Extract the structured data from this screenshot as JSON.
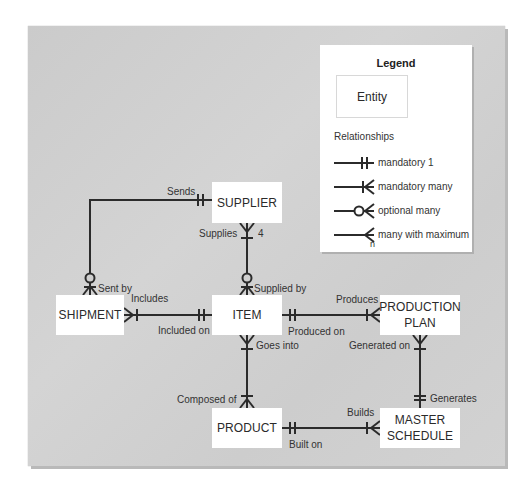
{
  "legend": {
    "title": "Legend",
    "entity_label": "Entity",
    "relationships_title": "Relationships",
    "items": [
      {
        "symbol": "mandatory-one",
        "label": "mandatory 1"
      },
      {
        "symbol": "mandatory-many",
        "label": "mandatory many"
      },
      {
        "symbol": "optional-many",
        "label": "optional many"
      },
      {
        "symbol": "many-with-maximum",
        "label": "many with maximum",
        "sub": "n"
      }
    ]
  },
  "entities": {
    "supplier": "SUPPLIER",
    "shipment": "SHIPMENT",
    "item": "ITEM",
    "production_plan_1": "PRODUCTION",
    "production_plan_2": "PLAN",
    "product": "PRODUCT",
    "master_schedule_1": "MASTER",
    "master_schedule_2": "SCHEDULE"
  },
  "relationships": {
    "sends": "Sends",
    "sent_by": "Sent by",
    "supplies": "Supplies",
    "supplies_max": "4",
    "supplied_by": "Supplied by",
    "includes": "Includes",
    "included_on": "Included on",
    "produces": "Produces",
    "produced_on": "Produced on",
    "goes_into": "Goes into",
    "composed_of": "Composed of",
    "generated_on": "Generated on",
    "generates": "Generates",
    "builds": "Builds",
    "built_on": "Built on"
  },
  "colors": {
    "panel": "#cfcfcf",
    "entity_fill": "#ffffff",
    "line": "#2b2b2b",
    "text": "#2a2a2a"
  }
}
